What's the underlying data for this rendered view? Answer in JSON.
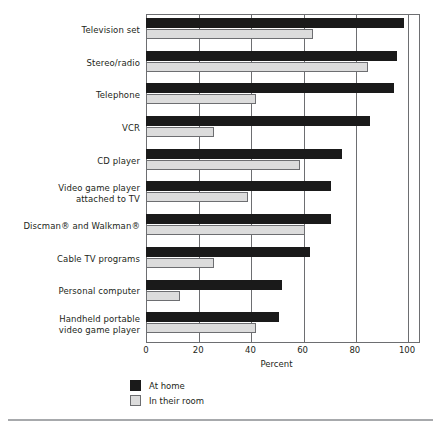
{
  "chart_data": {
    "type": "bar",
    "orientation": "horizontal",
    "title": "",
    "xlabel": "Percent",
    "ylabel": "",
    "xlim": [
      0,
      100
    ],
    "xticks": [
      0,
      20,
      40,
      60,
      80,
      100
    ],
    "grid": true,
    "legend_position": "bottom-left",
    "categories": [
      "Television set",
      "Stereo/radio",
      "Telephone",
      "VCR",
      "CD player",
      "Video game player attached to TV",
      "Discman® and Walkman®",
      "Cable TV programs",
      "Personal computer",
      "Handheld portable video game player"
    ],
    "category_lines": [
      [
        "Television set"
      ],
      [
        "Stereo/radio"
      ],
      [
        "Telephone"
      ],
      [
        "VCR"
      ],
      [
        "CD player"
      ],
      [
        "Video game player",
        "attached to TV"
      ],
      [
        "Discman® and Walkman®"
      ],
      [
        "Cable TV programs"
      ],
      [
        "Personal computer"
      ],
      [
        "Handheld portable",
        "video game player"
      ]
    ],
    "series": [
      {
        "name": "At home",
        "color": "#1a1a1a",
        "values": [
          99,
          96,
          95,
          86,
          75,
          71,
          71,
          63,
          52,
          51
        ]
      },
      {
        "name": "In their room",
        "color": "#dcdcdc",
        "values": [
          64,
          85,
          42,
          26,
          59,
          39,
          61,
          26,
          13,
          42
        ]
      }
    ]
  },
  "axis": {
    "tick_labels": [
      "0",
      "20",
      "40",
      "60",
      "80",
      "100"
    ],
    "x_axis_title": "Percent"
  },
  "legend": {
    "items": [
      {
        "label": "At home",
        "swatch": "dark-square"
      },
      {
        "label": "In their room",
        "swatch": "light-square"
      }
    ]
  },
  "colors": {
    "series_home": "#1a1a1a",
    "series_room": "#dcdcdc",
    "frame": "#6d6e71",
    "text": "#231f20",
    "rule": "#a7a9ac"
  }
}
